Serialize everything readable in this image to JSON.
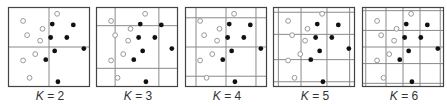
{
  "figure": {
    "box": {
      "width": 81,
      "height": 79,
      "top": 7
    },
    "colors": {
      "border": "#444444",
      "grid": "#8a8a8a",
      "open_point": "#999999",
      "filled_point": "#111111"
    },
    "points": {
      "open": [
        [
          0.18,
          0.17
        ],
        [
          0.42,
          0.27
        ],
        [
          0.23,
          0.35
        ],
        [
          0.39,
          0.42
        ],
        [
          0.33,
          0.59
        ],
        [
          0.18,
          0.67
        ],
        [
          0.26,
          0.89
        ],
        [
          0.6,
          0.08
        ]
      ],
      "filled": [
        [
          0.54,
          0.21
        ],
        [
          0.8,
          0.22
        ],
        [
          0.52,
          0.38
        ],
        [
          0.72,
          0.38
        ],
        [
          0.57,
          0.55
        ],
        [
          0.93,
          0.52
        ],
        [
          0.46,
          0.66
        ],
        [
          0.61,
          0.94
        ]
      ]
    },
    "panels": [
      {
        "k_var": "K",
        "k_value": "2",
        "left": 8,
        "vlines": [
          0.5
        ],
        "hlines": [
          0.5
        ]
      },
      {
        "k_var": "K",
        "k_value": "3",
        "left": 96,
        "vlines": [
          0.23,
          0.77
        ],
        "hlines": [
          0.23,
          0.77
        ]
      },
      {
        "k_var": "K",
        "k_value": "4",
        "left": 185,
        "vlines": [
          0.13,
          0.5,
          0.87
        ],
        "hlines": [
          0.13,
          0.5,
          0.87
        ]
      },
      {
        "k_var": "K",
        "k_value": "5",
        "left": 273,
        "vlines": [
          0.06,
          0.34,
          0.66,
          0.94
        ],
        "hlines": [
          0.06,
          0.34,
          0.66,
          0.94
        ]
      },
      {
        "k_var": "K",
        "k_value": "6",
        "left": 362,
        "vlines": [
          0.04,
          0.29,
          0.5,
          0.71,
          0.96
        ],
        "hlines": [
          0.04,
          0.29,
          0.5,
          0.71,
          0.96
        ]
      }
    ]
  }
}
